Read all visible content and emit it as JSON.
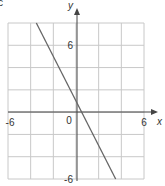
{
  "part_label": "c",
  "chart_data": {
    "type": "line",
    "title": "",
    "xlabel": "x",
    "ylabel": "y",
    "xlim": [
      -6,
      6
    ],
    "ylim": [
      -6,
      8
    ],
    "grid": true,
    "grid_step": 2,
    "x_ticks": [
      {
        "value": -6,
        "label": "-6"
      },
      {
        "value": 0,
        "label": "0"
      },
      {
        "value": 6,
        "label": "6"
      }
    ],
    "y_ticks": [
      {
        "value": 6,
        "label": "6"
      },
      {
        "value": -6,
        "label": "-6"
      }
    ],
    "series": [
      {
        "name": "y = -2x + 1",
        "x": [
          -3.5,
          3.5
        ],
        "y": [
          8,
          -6
        ],
        "color": "#666666"
      }
    ]
  },
  "colors": {
    "grid": "#c8c8c8",
    "axis": "#444444",
    "line": "#666666",
    "text": "#333333"
  }
}
